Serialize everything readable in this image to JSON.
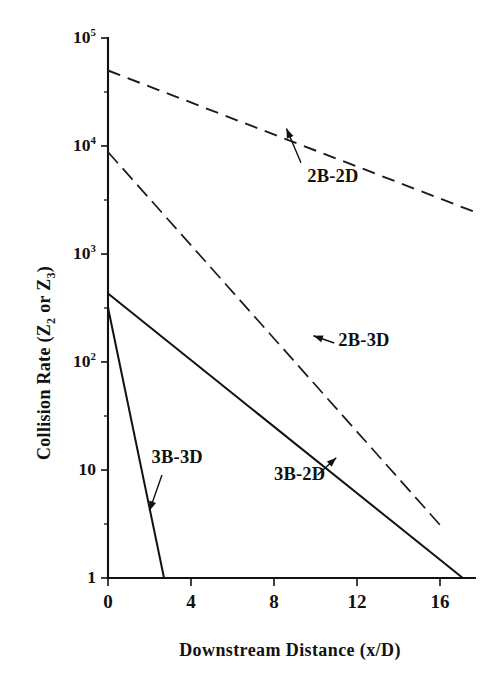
{
  "chart_data": {
    "type": "line",
    "title": "",
    "xlabel": "Downstream Distance (x/D)",
    "ylabel_html": "Collision Rate (Z<sub>2</sub> or Z<sub>3</sub>)",
    "ylabel_text": "Collision Rate (Z2 or Z3)",
    "xlim": [
      0,
      17.8
    ],
    "ylim": [
      1,
      100000
    ],
    "yscale": "log",
    "xscale": "linear",
    "grid": false,
    "legend_position": "inline-annotations",
    "xticks": [
      0,
      4,
      8,
      12,
      16
    ],
    "xtick_labels": [
      "0",
      "4",
      "8",
      "12",
      "16"
    ],
    "yticks": [
      1,
      10,
      100,
      1000,
      10000,
      100000
    ],
    "ytick_labels": [
      "1",
      "10",
      "10^2",
      "10^3",
      "10^4",
      "10^5"
    ],
    "ytick_mantissa": [
      "1",
      "10",
      "10",
      "10",
      "10",
      "10"
    ],
    "ytick_exponent": [
      "",
      "",
      "2",
      "3",
      "4",
      "5"
    ],
    "series": [
      {
        "name": "2B-2D",
        "style": "dashed",
        "x": [
          0,
          17.8
        ],
        "y": [
          50000,
          2400
        ],
        "label": "2B-2D",
        "label_x": 9.6,
        "label_y": 5200,
        "arrow_from_x": 9.3,
        "arrow_from_y": 7000,
        "arrow_to_x": 8.6,
        "arrow_to_y": 14500
      },
      {
        "name": "2B-3D",
        "style": "dash-dot",
        "x": [
          0,
          16.0
        ],
        "y": [
          8800,
          3.1
        ],
        "label": "2B-3D",
        "label_x": 11.1,
        "label_y": 155,
        "arrow_from_x": 10.9,
        "arrow_from_y": 150,
        "arrow_to_x": 9.9,
        "arrow_to_y": 175
      },
      {
        "name": "3B-2D",
        "style": "solid",
        "x": [
          0,
          17.1
        ],
        "y": [
          430,
          1
        ],
        "label": "3B-2D",
        "label_x": 8.0,
        "label_y": 9.0,
        "arrow_from_x": 10.1,
        "arrow_from_y": 9.0,
        "arrow_to_x": 11.0,
        "arrow_to_y": 13.0
      },
      {
        "name": "3B-3D",
        "style": "solid",
        "x": [
          0,
          2.7
        ],
        "y": [
          320,
          1
        ],
        "label": "3B-3D",
        "label_x": 2.1,
        "label_y": 13.0,
        "arrow_from_x": 2.6,
        "arrow_from_y": 9.0,
        "arrow_to_x": 2.0,
        "arrow_to_y": 4.2
      }
    ]
  }
}
